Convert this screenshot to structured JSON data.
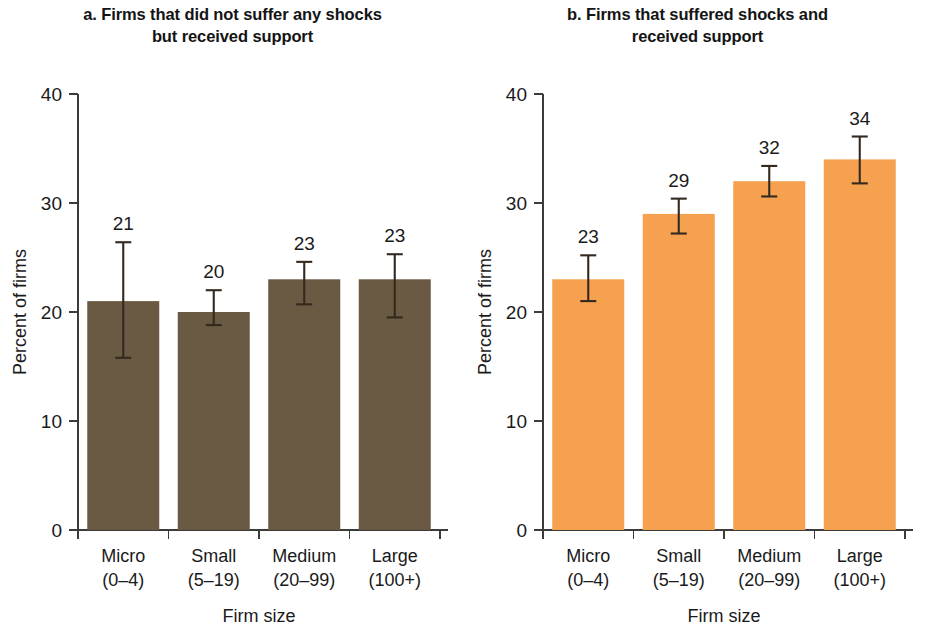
{
  "figure": {
    "panels": [
      {
        "id": "panel-a",
        "title_line1": "a. Firms that did not suffer any shocks",
        "title_line2": "but received support",
        "bar_color": "#6B5A43",
        "ylabel": "Percent of firms",
        "xlabel": "Firm size"
      },
      {
        "id": "panel-b",
        "title_line1": "b. Firms that suffered shocks and",
        "title_line2": "received support",
        "bar_color": "#F5A14F",
        "ylabel": "Percent of firms",
        "xlabel": "Firm size"
      }
    ]
  },
  "chart_data": [
    {
      "type": "bar",
      "title": "a. Firms that did not suffer any shocks but received support",
      "xlabel": "Firm size",
      "ylabel": "Percent of firms",
      "ylim": [
        0,
        40
      ],
      "yticks": [
        0,
        10,
        20,
        30,
        40
      ],
      "ytick_labels": [
        "0",
        "10",
        "20",
        "30",
        "40"
      ],
      "grid": false,
      "legend": "none",
      "bar_color": "#6B5A43",
      "categories": [
        "Micro",
        "Small",
        "Medium",
        "Large"
      ],
      "category_sublabels": [
        "(0–4)",
        "(5–19)",
        "(20–99)",
        "(100+)"
      ],
      "values": [
        21,
        20,
        23,
        23
      ],
      "data_labels": [
        "21",
        "20",
        "23",
        "23"
      ],
      "error_low": [
        15.8,
        18.8,
        20.7,
        19.5
      ],
      "error_high": [
        26.4,
        22.0,
        24.6,
        25.3
      ]
    },
    {
      "type": "bar",
      "title": "b. Firms that suffered shocks and received support",
      "xlabel": "Firm size",
      "ylabel": "Percent of firms",
      "ylim": [
        0,
        40
      ],
      "yticks": [
        0,
        10,
        20,
        30,
        40
      ],
      "ytick_labels": [
        "0",
        "10",
        "20",
        "30",
        "40"
      ],
      "grid": false,
      "legend": "none",
      "bar_color": "#F5A14F",
      "categories": [
        "Micro",
        "Small",
        "Medium",
        "Large"
      ],
      "category_sublabels": [
        "(0–4)",
        "(5–19)",
        "(20–99)",
        "(100+)"
      ],
      "values": [
        23,
        29,
        32,
        34
      ],
      "data_labels": [
        "23",
        "29",
        "32",
        "34"
      ],
      "error_low": [
        21.0,
        27.2,
        30.6,
        31.8
      ],
      "error_high": [
        25.2,
        30.4,
        33.4,
        36.1
      ]
    }
  ]
}
